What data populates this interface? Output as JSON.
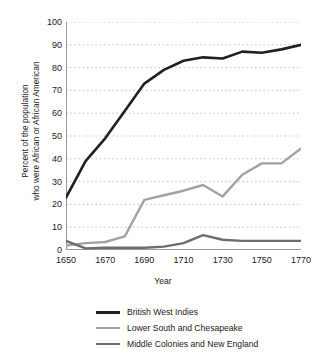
{
  "chart_data": {
    "type": "line",
    "title": "",
    "xlabel": "Year",
    "ylabel": "Percent of the population who were African or African American",
    "ylabel_line1": "Percent of the population",
    "ylabel_line2": "who were African or African American",
    "xlim": [
      1650,
      1770
    ],
    "ylim": [
      0,
      100
    ],
    "grid": true,
    "grid_style": "dashed-horizontal",
    "legend_position": "bottom",
    "x_tick_labels": [
      "1650",
      "1670",
      "1690",
      "1710",
      "1730",
      "1750",
      "1770"
    ],
    "x_ticks": [
      1650,
      1670,
      1690,
      1710,
      1730,
      1750,
      1770
    ],
    "y_tick_labels": [
      "0",
      "10",
      "20",
      "30",
      "40",
      "50",
      "60",
      "70",
      "80",
      "90",
      "100"
    ],
    "y_ticks": [
      0,
      10,
      20,
      30,
      40,
      50,
      60,
      70,
      80,
      90,
      100
    ],
    "x": [
      1650,
      1660,
      1670,
      1680,
      1690,
      1700,
      1710,
      1720,
      1730,
      1740,
      1750,
      1760,
      1770
    ],
    "series": [
      {
        "name": "British West Indies",
        "color": "#231f20",
        "width": 2.6,
        "values": [
          23,
          39,
          49,
          61,
          73,
          79,
          83,
          84.5,
          84,
          87,
          86.5,
          88,
          90
        ]
      },
      {
        "name": "Lower South and Chesapeake",
        "color": "#a3a3a3",
        "width": 2.4,
        "values": [
          2,
          3,
          3.5,
          6,
          22,
          24,
          26,
          28.5,
          23.5,
          33,
          38,
          38,
          44.5
        ]
      },
      {
        "name": "Middle Colonies and New England",
        "color": "#6d6d6d",
        "width": 2.4,
        "values": [
          4,
          0.7,
          1,
          1,
          1,
          1.5,
          3,
          6.5,
          4.5,
          4,
          4,
          4,
          4
        ]
      }
    ]
  },
  "axes": {
    "axis_color": "#9a9a9a",
    "grid_color": "#bdbdbd",
    "text_color": "#1a1a1a"
  },
  "legend": {
    "items": [
      {
        "label": "British West Indies",
        "color": "#231f20",
        "width": 3.2
      },
      {
        "label": "Lower South and Chesapeake",
        "color": "#a3a3a3",
        "width": 2.6
      },
      {
        "label": "Middle Colonies and New England",
        "color": "#6d6d6d",
        "width": 2.6
      }
    ]
  }
}
